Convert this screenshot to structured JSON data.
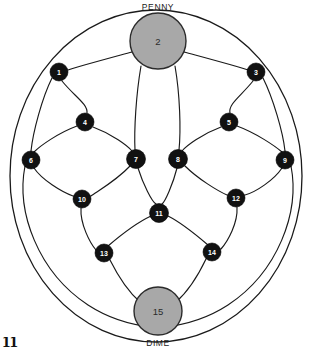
{
  "diagram": {
    "title_top": "PENNY",
    "title_bottom": "DIME",
    "type": "graph-puzzle-board",
    "background_color": "#ffffff",
    "edge_color": "#1a1a1a",
    "small_node_fill": "#111111",
    "small_node_text_color": "#ffffff",
    "coin_node_fill": "#a8a8a8",
    "coin_node_text_color": "#2b2b2b",
    "outer_ring": {
      "cx": 156,
      "cy": 176,
      "rx": 146,
      "ry": 166
    },
    "corner_artifact": "11",
    "nodes": [
      {
        "id": "1",
        "label": "1",
        "x": 59,
        "y": 72,
        "r": 9,
        "kind": "small"
      },
      {
        "id": "2",
        "label": "2",
        "x": 158,
        "y": 41,
        "r": 28,
        "kind": "coin",
        "coin_label": "PENNY"
      },
      {
        "id": "3",
        "label": "3",
        "x": 256,
        "y": 72,
        "r": 9,
        "kind": "small"
      },
      {
        "id": "4",
        "label": "4",
        "x": 85,
        "y": 122,
        "r": 9,
        "kind": "small"
      },
      {
        "id": "5",
        "label": "5",
        "x": 229,
        "y": 122,
        "r": 9,
        "kind": "small"
      },
      {
        "id": "6",
        "label": "6",
        "x": 31,
        "y": 160,
        "r": 9,
        "kind": "small"
      },
      {
        "id": "7",
        "label": "7",
        "x": 136,
        "y": 159,
        "r": 9.5,
        "kind": "small"
      },
      {
        "id": "8",
        "label": "8",
        "x": 178,
        "y": 159,
        "r": 9.5,
        "kind": "small"
      },
      {
        "id": "9",
        "label": "9",
        "x": 285,
        "y": 160,
        "r": 9,
        "kind": "small"
      },
      {
        "id": "10",
        "label": "10",
        "x": 82,
        "y": 199,
        "r": 9,
        "kind": "small"
      },
      {
        "id": "11",
        "label": "11",
        "x": 159,
        "y": 213,
        "r": 9.5,
        "kind": "small"
      },
      {
        "id": "12",
        "label": "12",
        "x": 236,
        "y": 198,
        "r": 9,
        "kind": "small"
      },
      {
        "id": "13",
        "label": "13",
        "x": 104,
        "y": 253,
        "r": 9,
        "kind": "small"
      },
      {
        "id": "14",
        "label": "14",
        "x": 212,
        "y": 252,
        "r": 9,
        "kind": "small"
      },
      {
        "id": "15",
        "label": "15",
        "x": 158,
        "y": 311,
        "r": 24,
        "kind": "coin",
        "coin_label": "DIME"
      }
    ],
    "edges": [
      {
        "from": "2",
        "to": "1",
        "d": "M 132 52 C 110 58 80 66 68 70"
      },
      {
        "from": "2",
        "to": "3",
        "d": "M 184 52 C 206 58 236 66 248 70"
      },
      {
        "from": "1",
        "to": "4",
        "d": "M 62 81 C 74 96 88 104 87 113"
      },
      {
        "from": "3",
        "to": "5",
        "d": "M 253 81 C 241 96 228 104 230 113"
      },
      {
        "from": "1",
        "to": "6",
        "d": "M 52 78 C 42 98 33 132 31 151"
      },
      {
        "from": "3",
        "to": "9",
        "d": "M 263 78 C 273 98 283 132 285 151"
      },
      {
        "from": "2",
        "to": "7",
        "d": "M 141 66 C 136 95 134 130 135 150"
      },
      {
        "from": "2",
        "to": "8",
        "d": "M 175 66 C 180 95 181 130 179 150"
      },
      {
        "from": "4",
        "to": "6",
        "d": "M 77 126 C 58 133 40 146 34 152"
      },
      {
        "from": "4",
        "to": "7",
        "d": "M 93 127 C 112 134 128 146 132 151"
      },
      {
        "from": "5",
        "to": "8",
        "d": "M 221 127 C 202 134 186 146 182 151"
      },
      {
        "from": "5",
        "to": "9",
        "d": "M 237 126 C 256 133 275 146 282 152"
      },
      {
        "from": "6",
        "to": "10",
        "d": "M 34 168 C 42 180 62 192 73 196"
      },
      {
        "from": "7",
        "to": "10",
        "d": "M 130 166 C 117 180 98 191 91 196"
      },
      {
        "from": "8",
        "to": "12",
        "d": "M 185 166 C 198 179 218 191 227 195"
      },
      {
        "from": "9",
        "to": "12",
        "d": "M 282 168 C 274 180 256 192 245 195"
      },
      {
        "from": "7",
        "to": "11",
        "d": "M 138 168 C 143 184 152 202 156 204"
      },
      {
        "from": "8",
        "to": "11",
        "d": "M 177 168 C 173 184 165 202 162 204"
      },
      {
        "from": "10",
        "to": "13",
        "d": "M 81 208 C 80 224 90 243 96 250"
      },
      {
        "from": "12",
        "to": "14",
        "d": "M 237 207 C 238 223 228 241 221 249"
      },
      {
        "from": "11",
        "to": "13",
        "d": "M 151 216 C 136 223 115 240 108 246"
      },
      {
        "from": "11",
        "to": "14",
        "d": "M 168 216 C 182 223 201 239 208 245"
      },
      {
        "from": "13",
        "to": "15",
        "d": "M 110 260 C 120 280 132 295 140 302"
      },
      {
        "from": "14",
        "to": "15",
        "d": "M 206 259 C 196 280 184 295 176 302"
      },
      {
        "from": "6",
        "to": "15-outer",
        "d": "M 25 166 C 16 212 38 272 88 305 C 108 318 132 325 152 327"
      },
      {
        "from": "9",
        "to": "15-outer",
        "d": "M 291 166 C 300 212 278 272 228 305 C 208 318 184 325 164 327"
      }
    ]
  }
}
